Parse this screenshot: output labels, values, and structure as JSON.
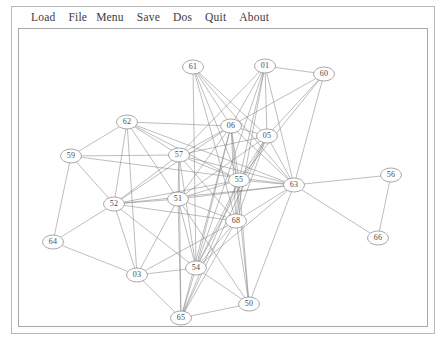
{
  "window": {
    "title": "Graph Viewer"
  },
  "menubar": {
    "items": [
      {
        "label": "Load",
        "name": "menu-load"
      },
      {
        "label": "File",
        "name": "menu-file"
      },
      {
        "label": "Menu",
        "name": "menu-menu"
      },
      {
        "label": "Save",
        "name": "menu-save"
      },
      {
        "label": "Dos",
        "name": "menu-dos"
      },
      {
        "label": "Quit",
        "name": "menu-quit"
      },
      {
        "label": "About",
        "name": "menu-about"
      }
    ]
  },
  "colors": {
    "background": "#ffffff",
    "edge": "#7d7d7d",
    "node_stroke": "#6e6e6e",
    "node_fill": "#ffffff",
    "text": "#3c3c3c",
    "frame": "#a8a8a8"
  },
  "graph": {
    "node_count": 20,
    "edge_count": 93,
    "nodes": [
      {
        "id": "61",
        "label": "61",
        "x": 174,
        "y": 38
      },
      {
        "id": "01",
        "label": "01",
        "x": 246,
        "y": 37
      },
      {
        "id": "60",
        "label": "60",
        "x": 305,
        "y": 45
      },
      {
        "id": "62",
        "label": "62",
        "x": 108,
        "y": 93
      },
      {
        "id": "06",
        "label": "06",
        "x": 212,
        "y": 97
      },
      {
        "id": "05",
        "label": "05",
        "x": 248,
        "y": 107
      },
      {
        "id": "59",
        "label": "59",
        "x": 52,
        "y": 127
      },
      {
        "id": "57",
        "label": "57",
        "x": 160,
        "y": 126
      },
      {
        "id": "55",
        "label": "55",
        "x": 220,
        "y": 151
      },
      {
        "id": "63",
        "label": "63",
        "x": 275,
        "y": 156
      },
      {
        "id": "56",
        "label": "56",
        "x": 372,
        "y": 146
      },
      {
        "id": "52",
        "label": "52",
        "x": 95,
        "y": 175
      },
      {
        "id": "51",
        "label": "51",
        "x": 159,
        "y": 170
      },
      {
        "id": "68",
        "label": "68",
        "x": 217,
        "y": 192
      },
      {
        "id": "64",
        "label": "64",
        "x": 34,
        "y": 213
      },
      {
        "id": "66",
        "label": "66",
        "x": 359,
        "y": 209
      },
      {
        "id": "03",
        "label": "03",
        "x": 118,
        "y": 246
      },
      {
        "id": "54",
        "label": "54",
        "x": 177,
        "y": 239
      },
      {
        "id": "50",
        "label": "50",
        "x": 230,
        "y": 275
      },
      {
        "id": "65",
        "label": "65",
        "x": 162,
        "y": 289
      }
    ],
    "edges": [
      [
        "61",
        "06"
      ],
      [
        "61",
        "05"
      ],
      [
        "61",
        "55"
      ],
      [
        "61",
        "63"
      ],
      [
        "61",
        "68"
      ],
      [
        "61",
        "54"
      ],
      [
        "01",
        "06"
      ],
      [
        "01",
        "05"
      ],
      [
        "01",
        "60"
      ],
      [
        "01",
        "55"
      ],
      [
        "01",
        "63"
      ],
      [
        "01",
        "68"
      ],
      [
        "01",
        "57"
      ],
      [
        "01",
        "54"
      ],
      [
        "60",
        "06"
      ],
      [
        "60",
        "05"
      ],
      [
        "60",
        "55"
      ],
      [
        "60",
        "63"
      ],
      [
        "62",
        "59"
      ],
      [
        "62",
        "57"
      ],
      [
        "62",
        "52"
      ],
      [
        "62",
        "51"
      ],
      [
        "62",
        "06"
      ],
      [
        "62",
        "55"
      ],
      [
        "62",
        "63"
      ],
      [
        "06",
        "05"
      ],
      [
        "06",
        "57"
      ],
      [
        "06",
        "55"
      ],
      [
        "06",
        "63"
      ],
      [
        "06",
        "51"
      ],
      [
        "06",
        "68"
      ],
      [
        "06",
        "54"
      ],
      [
        "06",
        "65"
      ],
      [
        "06",
        "52"
      ],
      [
        "06",
        "50"
      ],
      [
        "05",
        "55"
      ],
      [
        "05",
        "63"
      ],
      [
        "05",
        "68"
      ],
      [
        "05",
        "54"
      ],
      [
        "05",
        "51"
      ],
      [
        "05",
        "65"
      ],
      [
        "59",
        "52"
      ],
      [
        "59",
        "64"
      ],
      [
        "59",
        "57"
      ],
      [
        "59",
        "63"
      ],
      [
        "57",
        "55"
      ],
      [
        "57",
        "51"
      ],
      [
        "57",
        "63"
      ],
      [
        "57",
        "68"
      ],
      [
        "57",
        "54"
      ],
      [
        "57",
        "52"
      ],
      [
        "57",
        "65"
      ],
      [
        "55",
        "63"
      ],
      [
        "55",
        "51"
      ],
      [
        "55",
        "68"
      ],
      [
        "55",
        "54"
      ],
      [
        "55",
        "52"
      ],
      [
        "55",
        "65"
      ],
      [
        "55",
        "50"
      ],
      [
        "63",
        "56"
      ],
      [
        "63",
        "66"
      ],
      [
        "63",
        "68"
      ],
      [
        "63",
        "51"
      ],
      [
        "63",
        "54"
      ],
      [
        "63",
        "52"
      ],
      [
        "63",
        "50"
      ],
      [
        "56",
        "66"
      ],
      [
        "52",
        "51"
      ],
      [
        "52",
        "64"
      ],
      [
        "52",
        "03"
      ],
      [
        "52",
        "68"
      ],
      [
        "52",
        "54"
      ],
      [
        "51",
        "68"
      ],
      [
        "51",
        "54"
      ],
      [
        "51",
        "03"
      ],
      [
        "51",
        "65"
      ],
      [
        "51",
        "50"
      ],
      [
        "68",
        "54"
      ],
      [
        "68",
        "65"
      ],
      [
        "68",
        "50"
      ],
      [
        "68",
        "03"
      ],
      [
        "64",
        "03"
      ],
      [
        "64",
        "59"
      ],
      [
        "03",
        "54"
      ],
      [
        "03",
        "65"
      ],
      [
        "03",
        "62"
      ],
      [
        "54",
        "65"
      ],
      [
        "54",
        "50"
      ],
      [
        "50",
        "65"
      ],
      [
        "51",
        "55"
      ],
      [
        "06",
        "55"
      ],
      [
        "55",
        "68"
      ],
      [
        "05",
        "57"
      ],
      [
        "68",
        "55"
      ],
      [
        "54",
        "68"
      ],
      [
        "63",
        "05"
      ]
    ]
  }
}
